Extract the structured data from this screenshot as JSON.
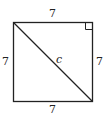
{
  "diagram": {
    "type": "square-with-diagonal",
    "labels": {
      "top": "7",
      "left": "7",
      "right": "7",
      "bottom": "7",
      "diagonal": "c"
    },
    "right_angle_marker": "top-right",
    "colors": {
      "stroke": "#222222",
      "background": "#ffffff"
    }
  }
}
